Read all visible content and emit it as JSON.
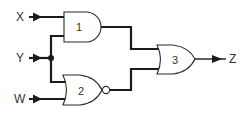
{
  "diagram": {
    "type": "logic-circuit",
    "inputs": [
      {
        "id": "X",
        "label": "X"
      },
      {
        "id": "Y",
        "label": "Y"
      },
      {
        "id": "W",
        "label": "W"
      }
    ],
    "outputs": [
      {
        "id": "Z",
        "label": "Z"
      }
    ],
    "gates": [
      {
        "id": "1",
        "label": "1",
        "type": "AND",
        "inputs": [
          "X",
          "Y"
        ]
      },
      {
        "id": "2",
        "label": "2",
        "type": "NOR",
        "inputs": [
          "Y",
          "W"
        ]
      },
      {
        "id": "3",
        "label": "3",
        "type": "OR",
        "inputs": [
          "1",
          "2"
        ],
        "output": "Z"
      }
    ],
    "colors": {
      "wire": "#1a1a1a",
      "text": "#333333",
      "background": "#ffffff"
    }
  }
}
